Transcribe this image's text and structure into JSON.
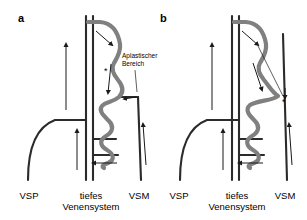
{
  "figure": {
    "type": "medical-diagram",
    "background_color": "#ffffff",
    "vessel_color": "#808080",
    "line_color": "#1a1a1a",
    "width": 307,
    "height": 220
  },
  "panels": [
    {
      "id": "a",
      "letter": "a",
      "labels": {
        "left": "VSP",
        "center": "tiefes\nVenensystem",
        "right": "VSM"
      },
      "callout": {
        "text": "Aplastischer\nBereich",
        "line1": "Aplastischer",
        "line2": "Bereich"
      },
      "star": "*",
      "arrows": [
        {
          "name": "deep-system-upflow",
          "direction": "up"
        },
        {
          "name": "deep-system-upflow-lower",
          "direction": "up"
        },
        {
          "name": "reflux-into-varix-upper",
          "direction": "down-right"
        },
        {
          "name": "reflux-down-varix",
          "direction": "down"
        },
        {
          "name": "perforator-inflow",
          "direction": "left"
        },
        {
          "name": "vsm-upflow",
          "direction": "up"
        },
        {
          "name": "aplastic-segment-pointer",
          "direction": "left"
        }
      ]
    },
    {
      "id": "b",
      "letter": "b",
      "labels": {
        "left": "VSP",
        "center": "tiefes\nVenensystem",
        "right": "VSM"
      },
      "star": "*",
      "arrows": [
        {
          "name": "deep-system-upflow",
          "direction": "up"
        },
        {
          "name": "deep-system-upflow-lower",
          "direction": "up"
        },
        {
          "name": "reflux-into-varix-upper",
          "direction": "down-right"
        },
        {
          "name": "reflux-down-varix",
          "direction": "down"
        },
        {
          "name": "perforator-inflow",
          "direction": "left"
        },
        {
          "name": "vsm-upflow",
          "direction": "up"
        },
        {
          "name": "vsm-short-downflow",
          "direction": "down"
        }
      ]
    }
  ]
}
